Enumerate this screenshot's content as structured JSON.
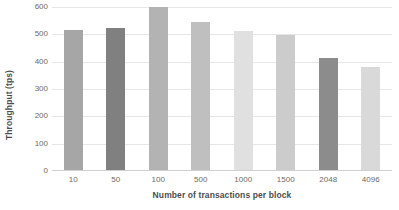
{
  "chart_data": {
    "type": "bar",
    "title": "",
    "xlabel": "Number of transactions per block",
    "ylabel": "Throughput (tps)",
    "categories": [
      "10",
      "50",
      "100",
      "500",
      "1000",
      "1500",
      "2048",
      "4096"
    ],
    "values": [
      512,
      518,
      595,
      540,
      507,
      495,
      408,
      378
    ],
    "series": [
      {
        "name": "Throughput",
        "values": [
          512,
          518,
          595,
          540,
          507,
          495,
          408,
          378
        ]
      }
    ],
    "bar_colors": [
      "#a6a6a6",
      "#808080",
      "#b3b3b3",
      "#bfbfbf",
      "#e0e0e0",
      "#cccccc",
      "#8c8c8c",
      "#d9d9d9"
    ],
    "ylim": [
      0,
      600
    ],
    "yticks": [
      0,
      100,
      200,
      300,
      400,
      500,
      600
    ],
    "ytick_labels": [
      "0",
      "100",
      "200",
      "300",
      "400",
      "500",
      "600"
    ],
    "grid": true,
    "grid_color": "#e6e6e6",
    "legend": false,
    "legend_position": "none",
    "background": "#ffffff",
    "text_color": "#595959"
  }
}
